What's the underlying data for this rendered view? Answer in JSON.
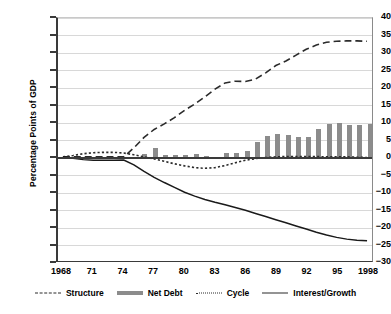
{
  "chart_data": {
    "type": "bar",
    "title": "",
    "xlabel": "",
    "ylabel": "Percentage Points of GDP",
    "ylim": [
      -30,
      40
    ],
    "ytick_step": 5,
    "yticks": [
      40,
      35,
      30,
      25,
      20,
      15,
      10,
      5,
      0,
      -5,
      -10,
      -15,
      -20,
      -25,
      -30
    ],
    "ytick_labels": [
      "40",
      "35",
      "30",
      "25",
      "20",
      "15",
      "10",
      "5",
      "0",
      "−5",
      "−10",
      "−15",
      "−20",
      "−25",
      "−30"
    ],
    "x": [
      1968,
      1969,
      1970,
      1971,
      1972,
      1973,
      1974,
      1975,
      1976,
      1977,
      1978,
      1979,
      1980,
      1981,
      1982,
      1983,
      1984,
      1985,
      1986,
      1987,
      1988,
      1989,
      1990,
      1991,
      1992,
      1993,
      1994,
      1995,
      1996,
      1997,
      1998
    ],
    "xtick_positions": [
      1968,
      1971,
      1974,
      1977,
      1980,
      1983,
      1986,
      1989,
      1992,
      1995,
      1998
    ],
    "xtick_labels": [
      "1968",
      "71",
      "74",
      "77",
      "80",
      "83",
      "86",
      "89",
      "92",
      "95",
      "1998"
    ],
    "grid": true,
    "legend_position": "bottom",
    "series": [
      {
        "name": "Net Debt",
        "style": "bar",
        "color": "#8c8c8c",
        "values": [
          0,
          0,
          0,
          0,
          0,
          0,
          0,
          0.4,
          1.1,
          2.8,
          1.0,
          0.9,
          0.9,
          1.2,
          0.5,
          0.3,
          1.4,
          1.4,
          2.1,
          4.5,
          6.2,
          6.8,
          6.5,
          5.9,
          6.1,
          8.4,
          9.8,
          9.9,
          9.4,
          9.4,
          9.6
        ]
      },
      {
        "name": "Cycle",
        "style": "long-dash",
        "color": "#2b2b2b",
        "values": [
          0,
          0,
          0,
          0,
          0,
          0,
          0,
          2.6,
          5.6,
          7.9,
          9.5,
          11.3,
          13.4,
          15.2,
          17.3,
          19.5,
          21.3,
          21.8,
          21.7,
          22.4,
          24.2,
          26.3,
          27.6,
          29.3,
          31.0,
          32.2,
          33.0,
          33.3,
          33.4,
          33.4,
          33.3
        ]
      },
      {
        "name": "Structure",
        "style": "dotted",
        "color": "#2b2b2b",
        "values": [
          0,
          0.4,
          0.9,
          1.2,
          1.3,
          1.3,
          1.1,
          0.6,
          0.0,
          -0.6,
          -1.3,
          -2.0,
          -2.6,
          -3.1,
          -3.3,
          -3.1,
          -2.5,
          -1.7,
          -1.0,
          -0.5,
          -0.2,
          0.0,
          0.1,
          0.1,
          0.1,
          0.1,
          0.0,
          0.0,
          0.0,
          -0.1,
          -0.2
        ]
      },
      {
        "name": "Interest/Growth",
        "style": "solid",
        "color": "#1a1a1a",
        "values": [
          0,
          -0.4,
          -0.8,
          -1.0,
          -1.0,
          -1.0,
          -0.9,
          -2.3,
          -4.2,
          -5.9,
          -7.4,
          -8.8,
          -10.2,
          -11.3,
          -12.3,
          -13.1,
          -13.8,
          -14.6,
          -15.4,
          -16.3,
          -17.2,
          -18.1,
          -19.0,
          -19.9,
          -20.8,
          -21.7,
          -22.5,
          -23.2,
          -23.7,
          -24.0,
          -24.2
        ]
      }
    ]
  },
  "legend": {
    "items": [
      {
        "label": "Structure",
        "key": "structure"
      },
      {
        "label": "Net Debt",
        "key": "netdebt"
      },
      {
        "label": "Cycle",
        "key": "cycle"
      },
      {
        "label": "Interest/Growth",
        "key": "interest"
      }
    ]
  }
}
